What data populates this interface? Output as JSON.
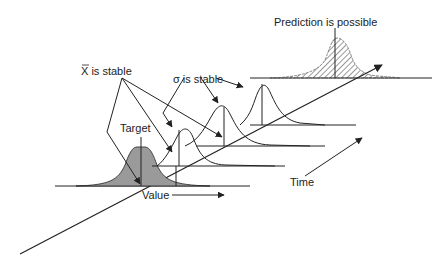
{
  "labels": {
    "xbar_stable": "X is stable",
    "xbar_symbol": "X",
    "xbar_rest": " is stable",
    "sigma_symbol": "σ",
    "sigma_rest": " is stable",
    "target": "Target",
    "value": "Value",
    "time": "Time",
    "prediction": "Prediction is possible"
  },
  "colors": {
    "line": "#222222",
    "shaded_fill": "#9a9a9a",
    "hatch": "#333333",
    "background": "#ffffff"
  }
}
